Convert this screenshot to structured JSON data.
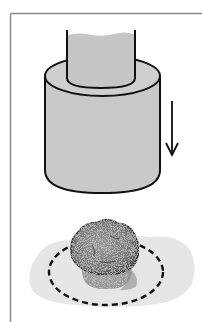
{
  "figure": {
    "colors": {
      "background": "#ffffff",
      "border": "#8a8a8a",
      "cylinder_fill": "#c9c9c9",
      "outline": "#111111",
      "spill_fill": "#e6e6e6",
      "sample_fill": "#7d7d7d",
      "sample_base": "#9a9a9a"
    },
    "elements": {
      "inner_shaft": "shaft-icon",
      "outer_cylinder": "cylinder-icon",
      "motion_arrow": "arrow-down-icon",
      "sample": "sample-lump-icon",
      "spill_area": "spill-area-icon",
      "dashed_outline": "dashed-circle-icon"
    }
  }
}
